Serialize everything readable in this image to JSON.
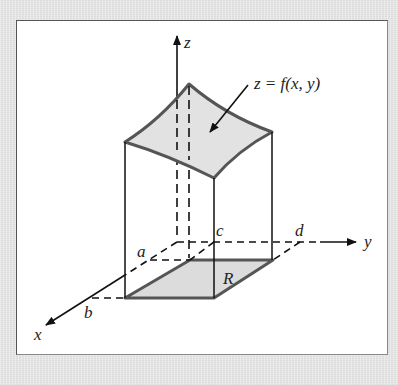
{
  "figure": {
    "type": "3d-volume-under-surface",
    "labels": {
      "z_axis": "z",
      "y_axis": "y",
      "x_axis": "x",
      "surface_equation": "z = f(x, y)",
      "a": "a",
      "b": "b",
      "c": "c",
      "d": "d",
      "region": "R"
    },
    "colors": {
      "background": "#e4e4e4",
      "frame": "#ffffff",
      "surface_fill": "#e2e2e2",
      "surface_edge": "#555555",
      "region_fill": "#dcdcdc",
      "lines": "#111111"
    }
  }
}
